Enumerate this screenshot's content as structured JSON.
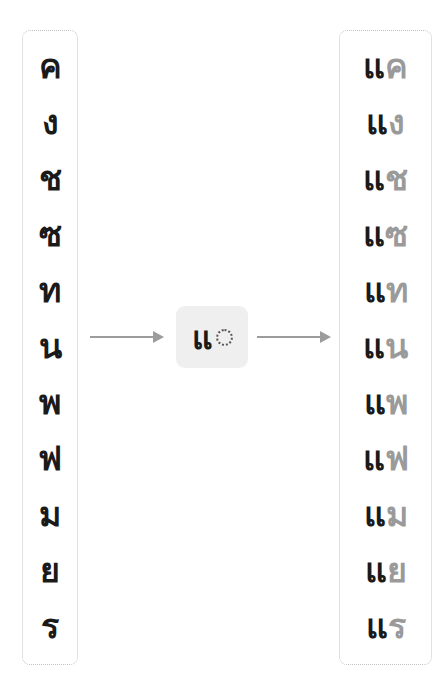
{
  "input_consonants": [
    "ค",
    "ง",
    "ช",
    "ซ",
    "ท",
    "น",
    "พ",
    "ฟ",
    "ม",
    "ย",
    "ร"
  ],
  "vowel_template": {
    "vowel": "แ",
    "placeholder": "dotted-circle"
  },
  "outputs": [
    {
      "vowel": "แ",
      "consonant": "ค"
    },
    {
      "vowel": "แ",
      "consonant": "ง"
    },
    {
      "vowel": "แ",
      "consonant": "ช"
    },
    {
      "vowel": "แ",
      "consonant": "ซ"
    },
    {
      "vowel": "แ",
      "consonant": "ท"
    },
    {
      "vowel": "แ",
      "consonant": "น"
    },
    {
      "vowel": "แ",
      "consonant": "พ"
    },
    {
      "vowel": "แ",
      "consonant": "ฟ"
    },
    {
      "vowel": "แ",
      "consonant": "ม"
    },
    {
      "vowel": "แ",
      "consonant": "ย"
    },
    {
      "vowel": "แ",
      "consonant": "ร"
    }
  ],
  "colors": {
    "text": "#1a1a1a",
    "consonant_output": "#9a9a9a",
    "arrow": "#9c9c9c",
    "center_bg": "#efefef",
    "border": "#c4c4c4"
  }
}
